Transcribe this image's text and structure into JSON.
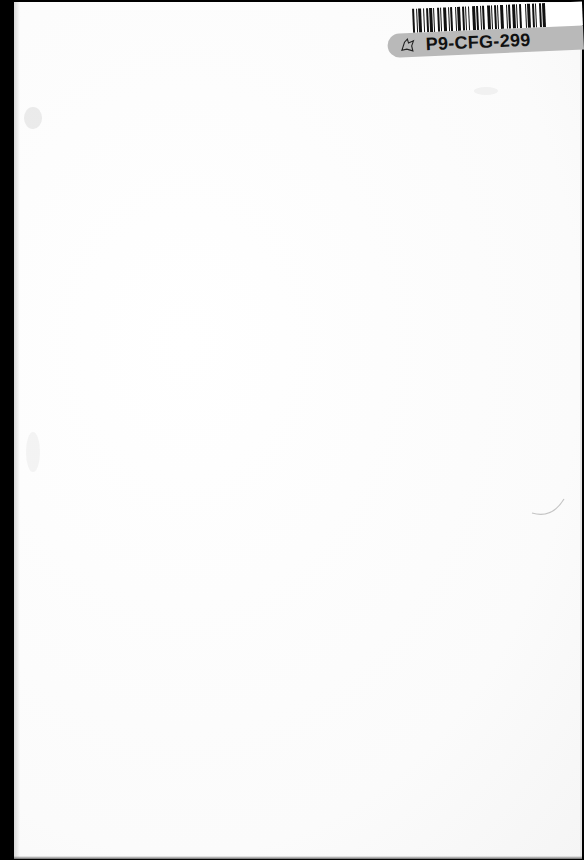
{
  "document": {
    "type": "blank book endpaper scan",
    "sticker": {
      "call_number": "P9-CFG-299",
      "icon": "library-mark-icon",
      "band_color": "#b9b9b9"
    },
    "colors": {
      "binding_edge": "#000000",
      "paper": "#fdfdfd"
    }
  }
}
